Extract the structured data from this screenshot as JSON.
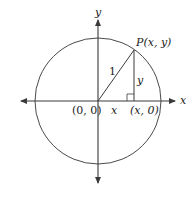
{
  "diagram": {
    "colors": {
      "stroke": "#3a3a3a",
      "text": "#222222",
      "background": "#ffffff"
    },
    "labels": {
      "y_axis": "y",
      "x_axis": "x",
      "point_p": "P(x, y)",
      "hypotenuse": "1",
      "vertical_leg": "y",
      "horizontal_leg": "x",
      "origin": "(0, 0)",
      "foot": "(x, 0)"
    }
  }
}
